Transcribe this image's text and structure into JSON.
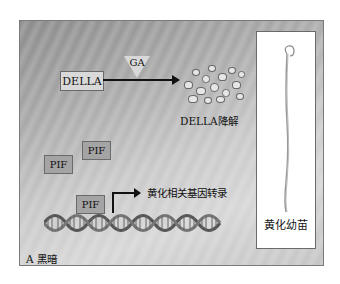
{
  "figure": {
    "panel_label": "A 黑暗",
    "ga_label": "GA",
    "della_label": "DELLA",
    "della_degradation_label": "DELLA降解",
    "pif_labels": [
      "PIF",
      "PIF",
      "PIF"
    ],
    "transcription_label": "黄化相关基因转录",
    "seedling_label": "黄化幼苗"
  },
  "colors": {
    "panel_background_dark": "#8a8a8a",
    "panel_background_light": "#d6d6d6",
    "della_box": "#d9d9d9",
    "pif_box": "#a4a4a4",
    "arrow": "#111111",
    "seedling_panel": "#ffffff"
  }
}
